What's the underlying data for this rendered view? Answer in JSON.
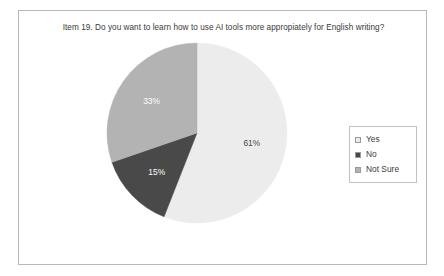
{
  "chart_data": {
    "type": "pie",
    "title": "Item 19. Do you want to learn how to use AI tools more appropiately for English writing?",
    "categories": [
      "Yes",
      "No",
      "Not Sure"
    ],
    "values": [
      61,
      15,
      33
    ],
    "data_labels": [
      "61%",
      "15%",
      "33%"
    ],
    "units": "percent",
    "start_angle_deg": 0,
    "direction": "clockwise",
    "colors": [
      "#ececec",
      "#494949",
      "#b3b3b3"
    ],
    "label_colors": [
      "#4a4a4a",
      "#ffffff",
      "#ffffff"
    ],
    "legend": {
      "position": "right",
      "entries": [
        {
          "label": "Yes",
          "color": "#ececec"
        },
        {
          "label": "No",
          "color": "#494949"
        },
        {
          "label": "Not Sure",
          "color": "#b3b3b3"
        }
      ]
    },
    "xlabel": "",
    "ylabel": "",
    "grid": false
  },
  "frame": {
    "border_color": "#b9b9b9",
    "background": "#ffffff"
  }
}
